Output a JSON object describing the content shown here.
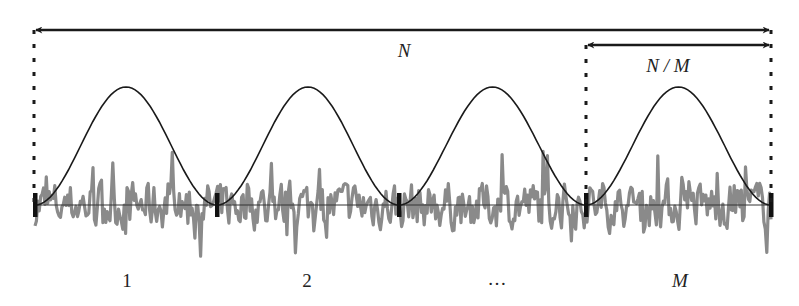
{
  "figure": {
    "width": 799,
    "height": 306,
    "background": "#ffffff"
  },
  "colors": {
    "arrow": "#1a1a1a",
    "dotted": "#1a1a1a",
    "window": "#1a1a1a",
    "baseline": "#333333",
    "signal": "#8a8a8a",
    "marker": "#111111",
    "text": "#222222"
  },
  "labels": {
    "total_length": "N",
    "segment_length": "N / M",
    "segments": [
      "1",
      "2",
      "…",
      "M"
    ]
  },
  "layout": {
    "baseline_y": 205,
    "window_peak_y": 87,
    "segment_boundaries_x": [
      35,
      217,
      399,
      586,
      771
    ],
    "total_arrow": {
      "x1": 34,
      "x2": 771,
      "y": 30
    },
    "segment_arrow": {
      "x1": 586,
      "x2": 771,
      "y": 45
    },
    "dotted_lines": [
      {
        "x": 34,
        "y1": 30,
        "y2": 205
      },
      {
        "x": 586,
        "y1": 45,
        "y2": 205
      },
      {
        "x": 771,
        "y1": 30,
        "y2": 205
      }
    ],
    "total_label_pos": {
      "x": 404,
      "y": 57
    },
    "segment_label_pos": {
      "x": 668,
      "y": 72
    },
    "segment_label_positions": [
      {
        "x": 127,
        "y": 287
      },
      {
        "x": 307,
        "y": 287
      },
      {
        "x": 497,
        "y": 285
      },
      {
        "x": 680,
        "y": 287
      }
    ]
  },
  "signal": {
    "description": "random noise signal split into M segments, each multiplied by a Hann window",
    "seed": 7,
    "samples": 520,
    "amplitude": 38
  }
}
